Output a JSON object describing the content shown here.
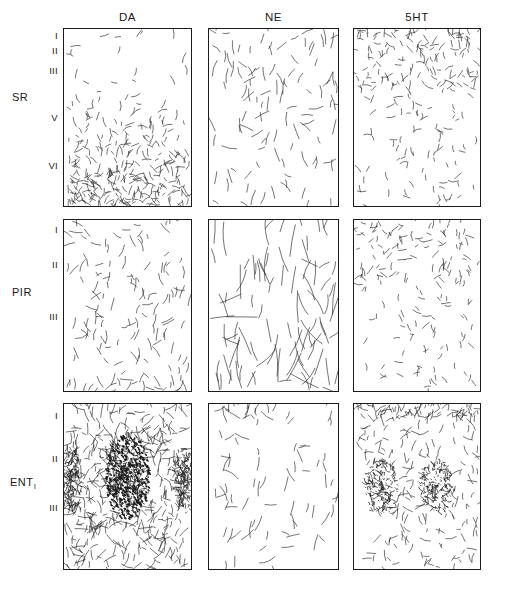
{
  "figure": {
    "background_color": "#ffffff",
    "ink_color": "#1b1b1b",
    "border_color": "#1b1b1b"
  },
  "columns": [
    {
      "id": "DA",
      "label": "DA",
      "name": "dopamine",
      "x": 127.5
    },
    {
      "id": "NE",
      "label": "NE",
      "name": "norepinephrine",
      "x": 274.5
    },
    {
      "id": "5HT",
      "label": "5HT",
      "name": "serotonin",
      "x": 418.0
    }
  ],
  "rows": [
    {
      "id": "SR",
      "label": "SR",
      "name": "somatosensory-cortex"
    },
    {
      "id": "PIR",
      "label": "PIR",
      "name": "piriform-cortex"
    },
    {
      "id": "ENT",
      "label": "ENT",
      "label_sub": "l",
      "name": "entorhinal-cortex"
    }
  ],
  "row_labels": {
    "SR": {
      "text": "SR",
      "x": 14,
      "y": 97
    },
    "PIR": {
      "text": "PIR",
      "x": 14,
      "y": 292
    },
    "ENT": {
      "text": "ENT",
      "sub": "l",
      "x": 14,
      "y": 482
    }
  },
  "layer_labels": {
    "SR": [
      {
        "text": "I",
        "y": 32
      },
      {
        "text": "II",
        "y": 48
      },
      {
        "text": "III",
        "y": 69
      },
      {
        "text": "V",
        "y": 116
      },
      {
        "text": "VI",
        "y": 164
      }
    ],
    "PIR": [
      {
        "text": "I",
        "y": 228
      },
      {
        "text": "II",
        "y": 263
      },
      {
        "text": "III",
        "y": 315
      }
    ],
    "ENT": [
      {
        "text": "I",
        "y": 414
      },
      {
        "text": "II",
        "y": 457
      },
      {
        "text": "III",
        "y": 506
      }
    ]
  },
  "panel_geometry": {
    "left_edges": [
      63,
      208,
      353
    ],
    "top_edges": [
      28,
      219,
      403
    ],
    "width": 129,
    "heights": [
      179,
      173,
      167
    ],
    "widths": [
      129,
      131,
      128
    ]
  },
  "chart_data": {
    "type": "scatter",
    "xlabel": "",
    "ylabel": "",
    "grid": false,
    "legend_position": "none",
    "categories": [
      "DA",
      "NE",
      "5HT"
    ],
    "row_categories": [
      "SR",
      "PIR",
      "ENT"
    ],
    "panels": [
      {
        "row": "SR",
        "column": "DA",
        "pattern": "gradient-deep",
        "density_profile": "sparse superficially (layers I-III), increasing sharply through layer V, very dense in layer VI",
        "relative_density": 0.62,
        "fiber_count_estimate": 320,
        "layers_marked": [
          "I",
          "II",
          "III",
          "V",
          "VI"
        ]
      },
      {
        "row": "SR",
        "column": "NE",
        "pattern": "uniform",
        "density_profile": "evenly distributed moderate-low density across all layers",
        "relative_density": 0.22,
        "fiber_count_estimate": 110,
        "layers_marked": [
          "I",
          "II",
          "III",
          "V",
          "VI"
        ]
      },
      {
        "row": "SR",
        "column": "5HT",
        "pattern": "gradient-superficial",
        "density_profile": "dense band in superficial layers I-III, sparse in deep layers V-VI",
        "relative_density": 0.4,
        "fiber_count_estimate": 230,
        "layers_marked": [
          "I",
          "II",
          "III",
          "V",
          "VI"
        ]
      },
      {
        "row": "PIR",
        "column": "DA",
        "pattern": "moderate-with-basal-band",
        "density_profile": "moderate scattered fibers throughout with a denser band at the deep border",
        "relative_density": 0.3,
        "fiber_count_estimate": 150,
        "layers_marked": [
          "I",
          "II",
          "III"
        ]
      },
      {
        "row": "PIR",
        "column": "NE",
        "pattern": "long-vertical-fibers",
        "density_profile": "sparse but long, radially oriented fibers traversing layers",
        "relative_density": 0.2,
        "fiber_count_estimate": 95,
        "layers_marked": [
          "I",
          "II",
          "III"
        ]
      },
      {
        "row": "PIR",
        "column": "5HT",
        "pattern": "gradient-superficial",
        "density_profile": "dense band in layer I, moderate uniform density below",
        "relative_density": 0.32,
        "fiber_count_estimate": 175,
        "layers_marked": [
          "I",
          "II",
          "III"
        ]
      },
      {
        "row": "ENT",
        "column": "DA",
        "pattern": "dense-central-cluster",
        "density_profile": "very dense punctate cluster centered in layer II with lateral satellite patches; sparse elsewhere",
        "relative_density": 0.45,
        "fiber_count_estimate": 420,
        "layers_marked": [
          "I",
          "II",
          "III"
        ]
      },
      {
        "row": "ENT",
        "column": "NE",
        "pattern": "uniform-sparse",
        "density_profile": "sparse evenly scattered fibers, slight increase at layer I",
        "relative_density": 0.18,
        "fiber_count_estimate": 85,
        "layers_marked": [
          "I",
          "II",
          "III"
        ]
      },
      {
        "row": "ENT",
        "column": "5HT",
        "pattern": "superficial-band-plus-patches",
        "density_profile": "dense band at layer I with moderate punctate patches in layer II/III",
        "relative_density": 0.35,
        "fiber_count_estimate": 260,
        "layers_marked": [
          "I",
          "II",
          "III"
        ]
      }
    ]
  }
}
